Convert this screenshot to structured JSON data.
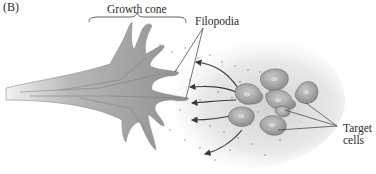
{
  "figure": {
    "panel_label": "(B)",
    "labels": {
      "growth_cone": "Growth cone",
      "filopodia": "Filopodia",
      "target_cells_line1": "Target",
      "target_cells_line2": "cells"
    },
    "colors": {
      "axon_fill": "#9a9a9a",
      "axon_dark": "#6e6e6e",
      "cell_fill": "#a8a8a8",
      "cell_nucleus": "#c9c9c9",
      "gradient_cloud": "#d8d8d8",
      "dots": "#7a7a7a",
      "arrow": "#3a3a3a",
      "label_text": "#2a2a2a"
    },
    "elements": {
      "growth_cone_count": 1,
      "target_cell_count": 7,
      "chemoattractant_arrows": 5,
      "filopodia_pointer_lines": 2,
      "target_pointer_lines": 3
    }
  }
}
